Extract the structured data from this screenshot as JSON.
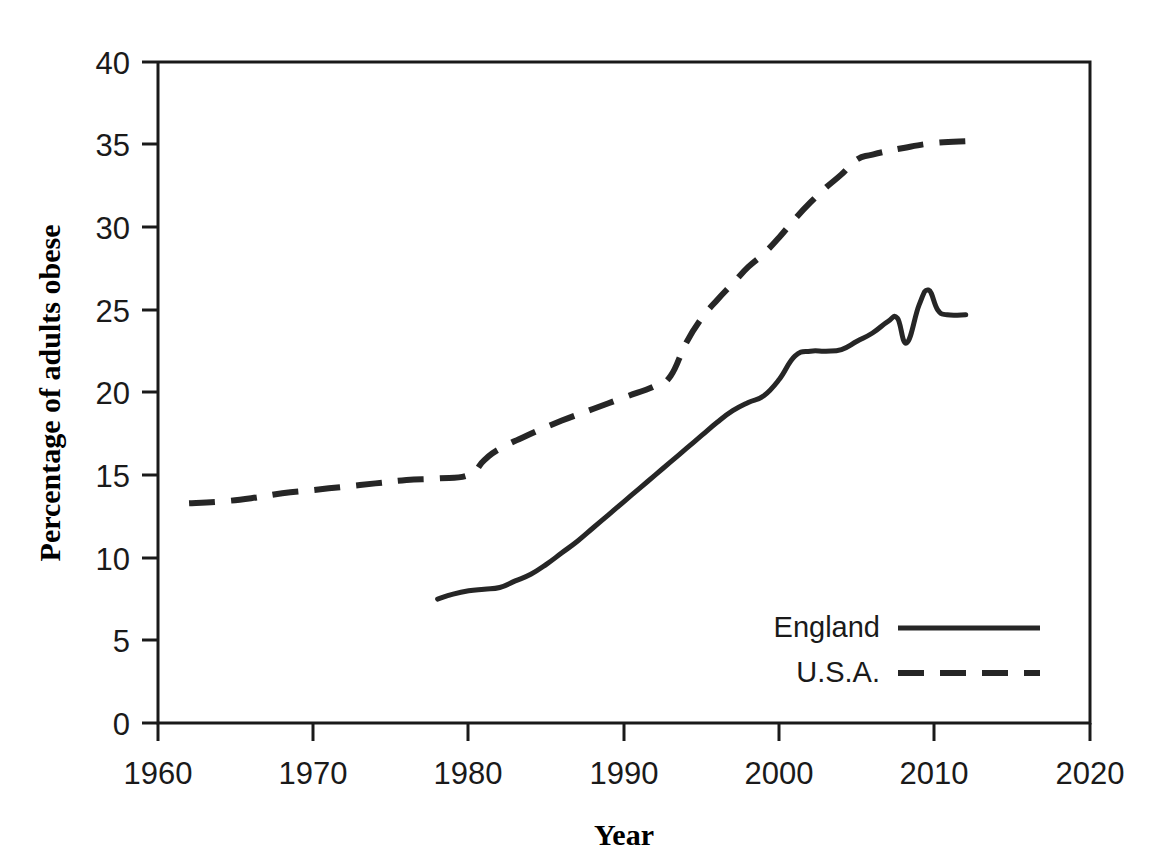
{
  "chart_data": {
    "type": "line",
    "title": "",
    "xlabel": "Year",
    "ylabel": "Percentage of adults obese",
    "xlim": [
      1960,
      2020
    ],
    "ylim": [
      0,
      40
    ],
    "grid": false,
    "legend_position": "bottom-right",
    "xticks": [
      1960,
      1970,
      1980,
      1990,
      2000,
      2010,
      2020
    ],
    "xtick_labels": [
      "1960",
      "1970",
      "1980",
      "1990",
      "2000",
      "2010",
      "2020"
    ],
    "yticks": [
      0,
      5,
      10,
      15,
      20,
      25,
      30,
      35,
      40
    ],
    "ytick_labels": [
      "0",
      "5",
      "10",
      "15",
      "20",
      "25",
      "30",
      "35",
      "40"
    ],
    "series": [
      {
        "name": "England",
        "style": "solid",
        "color": "#262626",
        "points": [
          [
            1978.0,
            7.5
          ],
          [
            1979.0,
            7.8
          ],
          [
            1980.0,
            8.0
          ],
          [
            1981.0,
            8.1
          ],
          [
            1982.0,
            8.2
          ],
          [
            1983.0,
            8.6
          ],
          [
            1984.0,
            9.0
          ],
          [
            1985.0,
            9.6
          ],
          [
            1986.0,
            10.3
          ],
          [
            1987.0,
            11.0
          ],
          [
            1988.0,
            11.8
          ],
          [
            1989.0,
            12.6
          ],
          [
            1990.0,
            13.4
          ],
          [
            1991.0,
            14.2
          ],
          [
            1992.0,
            15.0
          ],
          [
            1993.0,
            15.8
          ],
          [
            1994.0,
            16.6
          ],
          [
            1995.0,
            17.4
          ],
          [
            1996.0,
            18.2
          ],
          [
            1997.0,
            18.9
          ],
          [
            1998.0,
            19.4
          ],
          [
            1999.0,
            19.8
          ],
          [
            2000.0,
            20.8
          ],
          [
            2001.0,
            22.2
          ],
          [
            2002.0,
            22.5
          ],
          [
            2003.0,
            22.5
          ],
          [
            2004.0,
            22.6
          ],
          [
            2005.0,
            23.1
          ],
          [
            2006.0,
            23.6
          ],
          [
            2007.0,
            24.3
          ],
          [
            2007.6,
            24.5
          ],
          [
            2008.2,
            23.0
          ],
          [
            2009.0,
            25.3
          ],
          [
            2009.6,
            26.2
          ],
          [
            2010.2,
            25.0
          ],
          [
            2010.8,
            24.7
          ],
          [
            2012.0,
            24.7
          ]
        ]
      },
      {
        "name": "U.S.A.",
        "style": "dashed",
        "color": "#262626",
        "points": [
          [
            1962.0,
            13.3
          ],
          [
            1964.0,
            13.4
          ],
          [
            1966.0,
            13.6
          ],
          [
            1968.0,
            13.9
          ],
          [
            1970.0,
            14.1
          ],
          [
            1972.0,
            14.3
          ],
          [
            1974.0,
            14.5
          ],
          [
            1976.0,
            14.7
          ],
          [
            1978.0,
            14.8
          ],
          [
            1980.0,
            15.0
          ],
          [
            1981.0,
            15.9
          ],
          [
            1982.0,
            16.6
          ],
          [
            1984.0,
            17.5
          ],
          [
            1986.0,
            18.3
          ],
          [
            1988.0,
            19.0
          ],
          [
            1990.0,
            19.7
          ],
          [
            1992.0,
            20.4
          ],
          [
            1993.0,
            21.0
          ],
          [
            1994.0,
            23.0
          ],
          [
            1995.0,
            24.5
          ],
          [
            1996.0,
            25.6
          ],
          [
            1997.0,
            26.6
          ],
          [
            1998.0,
            27.6
          ],
          [
            1999.0,
            28.4
          ],
          [
            2000.0,
            29.4
          ],
          [
            2001.0,
            30.5
          ],
          [
            2002.0,
            31.5
          ],
          [
            2003.0,
            32.4
          ],
          [
            2004.0,
            33.2
          ],
          [
            2005.0,
            34.1
          ],
          [
            2006.0,
            34.4
          ],
          [
            2008.0,
            34.8
          ],
          [
            2010.0,
            35.1
          ],
          [
            2012.0,
            35.2
          ]
        ]
      }
    ]
  },
  "legend": {
    "items": [
      {
        "label": "England",
        "style": "solid"
      },
      {
        "label": "U.S.A.",
        "style": "dashed"
      }
    ]
  }
}
